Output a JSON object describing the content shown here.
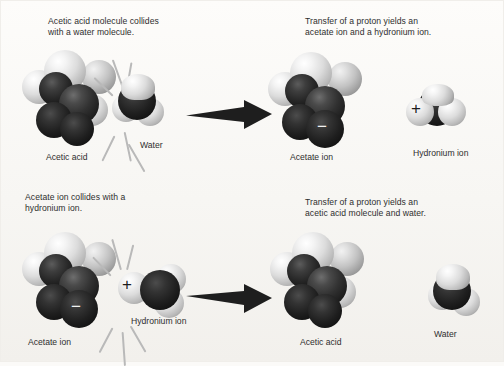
{
  "figure": {
    "background_color": "#fbfaf8",
    "arrow_color": "#1e1e1e",
    "spark_color": "#b9b9b9",
    "atom_light_color": "#e6e6e6",
    "atom_dark_color": "#242424"
  },
  "panels": [
    {
      "id": "forward-reactants",
      "caption": "Acetic acid molecule collides\nwith a water molecule.",
      "molecules": [
        {
          "name": "acetic-acid",
          "label": "Acetic acid",
          "charge": ""
        },
        {
          "name": "water",
          "label": "Water",
          "charge": ""
        }
      ],
      "collision": true
    },
    {
      "id": "forward-products",
      "caption": "Transfer of a proton yields an\nacetate ion and a hydronium ion.",
      "molecules": [
        {
          "name": "acetate-ion",
          "label": "Acetate ion",
          "charge": "−"
        },
        {
          "name": "hydronium-ion",
          "label": "Hydronium ion",
          "charge": "+"
        }
      ],
      "collision": false
    },
    {
      "id": "reverse-reactants",
      "caption": "Acetate ion collides with a\nhydronium ion.",
      "molecules": [
        {
          "name": "acetate-ion",
          "label": "Acetate ion",
          "charge": "−"
        },
        {
          "name": "hydronium-ion",
          "label": "Hydronium ion",
          "charge": "+"
        }
      ],
      "collision": true
    },
    {
      "id": "reverse-products",
      "caption": "Transfer of a proton yields an\nacetic acid molecule and water.",
      "molecules": [
        {
          "name": "acetic-acid",
          "label": "Acetic acid",
          "charge": ""
        },
        {
          "name": "water",
          "label": "Water",
          "charge": ""
        }
      ],
      "collision": false
    }
  ],
  "labels": {
    "acetic_acid": "Acetic acid",
    "water": "Water",
    "acetate_ion": "Acetate ion",
    "hydronium_ion": "Hydronium ion",
    "minus": "−",
    "plus": "+"
  },
  "captions": {
    "top_left": "Acetic acid molecule collides\nwith a water molecule.",
    "top_right": "Transfer of a proton yields an\nacetate ion and a hydronium ion.",
    "bottom_left": "Acetate ion collides with a\nhydronium ion.",
    "bottom_right": "Transfer of a proton yields an\nacetic acid molecule and water."
  },
  "icons": {
    "arrow": "reaction-arrow-right",
    "spark": "collision-spark"
  }
}
